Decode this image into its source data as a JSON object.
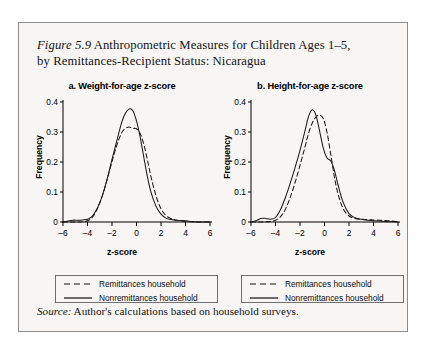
{
  "figure": {
    "number_label": "Figure 5.9",
    "title_line1": " Anthropometric Measures for Children Ages 1–5,",
    "title_line2": "by Remittances-Recipient Status: Nicaragua",
    "source_label": "Source:",
    "source_text": " Author's calculations based on household surveys."
  },
  "legend": {
    "dashed_label": "Remittances household",
    "solid_label": "Nonremittances household"
  },
  "chart_data": [
    {
      "type": "line",
      "panel_label": "a.",
      "title": "a. Weight-for-age z-score",
      "xlabel": "z-score",
      "ylabel": "Frequency",
      "xlim": [
        -6,
        6
      ],
      "ylim": [
        0,
        0.4
      ],
      "xticks": [
        -6,
        -4,
        -2,
        0,
        2,
        4,
        6
      ],
      "yticks": [
        0,
        0.1,
        0.2,
        0.3,
        0.4
      ],
      "grid": false,
      "legend_position": "below",
      "series": [
        {
          "name": "Nonremittances household",
          "style": "solid",
          "x": [
            -6.0,
            -5.6,
            -5.2,
            -4.8,
            -4.4,
            -4.0,
            -3.6,
            -3.2,
            -2.8,
            -2.4,
            -2.0,
            -1.6,
            -1.2,
            -0.9,
            -0.6,
            -0.3,
            0.0,
            0.3,
            0.6,
            0.9,
            1.2,
            1.6,
            2.0,
            2.4,
            2.8,
            3.2,
            3.6,
            4.0,
            4.4,
            5.0,
            6.0
          ],
          "y": [
            0.0,
            0.003,
            0.006,
            0.006,
            0.007,
            0.009,
            0.02,
            0.046,
            0.086,
            0.143,
            0.209,
            0.272,
            0.333,
            0.363,
            0.377,
            0.371,
            0.337,
            0.283,
            0.215,
            0.149,
            0.097,
            0.052,
            0.026,
            0.013,
            0.008,
            0.006,
            0.005,
            0.004,
            0.002,
            0.0,
            0.0
          ]
        },
        {
          "name": "Remittances household",
          "style": "dashed",
          "x": [
            -6.0,
            -5.6,
            -5.2,
            -4.8,
            -4.4,
            -4.0,
            -3.6,
            -3.2,
            -2.8,
            -2.4,
            -2.0,
            -1.6,
            -1.2,
            -0.9,
            -0.6,
            -0.3,
            0.0,
            0.3,
            0.6,
            0.9,
            1.2,
            1.6,
            2.0,
            2.4,
            2.8,
            3.2,
            3.6,
            4.0,
            4.4,
            5.0,
            6.0
          ],
          "y": [
            0.0,
            0.0,
            0.0,
            0.0,
            0.001,
            0.004,
            0.016,
            0.044,
            0.086,
            0.141,
            0.201,
            0.257,
            0.298,
            0.312,
            0.317,
            0.312,
            0.311,
            0.295,
            0.259,
            0.205,
            0.148,
            0.086,
            0.044,
            0.022,
            0.012,
            0.007,
            0.004,
            0.002,
            0.001,
            0.0,
            0.0
          ]
        }
      ]
    },
    {
      "type": "line",
      "panel_label": "b.",
      "title": "b. Height-for-age z-score",
      "xlabel": "z-score",
      "ylabel": "Frequency",
      "xlim": [
        -6,
        6
      ],
      "ylim": [
        0,
        0.4
      ],
      "xticks": [
        -6,
        -4,
        -2,
        0,
        2,
        4,
        6
      ],
      "yticks": [
        0,
        0.1,
        0.2,
        0.3,
        0.4
      ],
      "grid": false,
      "legend_position": "below",
      "series": [
        {
          "name": "Nonremittances household",
          "style": "solid",
          "x": [
            -6.0,
            -5.6,
            -5.2,
            -4.8,
            -4.4,
            -4.0,
            -3.6,
            -3.2,
            -2.8,
            -2.4,
            -2.0,
            -1.6,
            -1.3,
            -1.0,
            -0.7,
            -0.4,
            -0.1,
            0.2,
            0.5,
            0.8,
            1.1,
            1.5,
            2.0,
            2.5,
            3.0,
            3.5,
            4.0,
            4.5,
            5.0,
            5.5,
            6.0
          ],
          "y": [
            0.0,
            0.004,
            0.012,
            0.012,
            0.009,
            0.015,
            0.041,
            0.081,
            0.129,
            0.182,
            0.239,
            0.303,
            0.352,
            0.374,
            0.356,
            0.303,
            0.246,
            0.213,
            0.204,
            0.174,
            0.125,
            0.068,
            0.028,
            0.014,
            0.009,
            0.006,
            0.004,
            0.003,
            0.002,
            0.001,
            0.0
          ]
        },
        {
          "name": "Remittances household",
          "style": "dashed",
          "x": [
            -6.0,
            -5.6,
            -5.2,
            -4.8,
            -4.4,
            -4.0,
            -3.6,
            -3.2,
            -2.8,
            -2.4,
            -2.0,
            -1.6,
            -1.3,
            -1.0,
            -0.7,
            -0.4,
            -0.1,
            0.2,
            0.5,
            0.8,
            1.1,
            1.5,
            2.0,
            2.5,
            3.0,
            3.5,
            4.0,
            4.5,
            5.0,
            5.5,
            6.0
          ],
          "y": [
            0.0,
            0.0,
            0.0,
            0.001,
            0.002,
            0.006,
            0.017,
            0.042,
            0.082,
            0.132,
            0.189,
            0.249,
            0.296,
            0.33,
            0.35,
            0.356,
            0.345,
            0.3,
            0.228,
            0.152,
            0.095,
            0.046,
            0.02,
            0.012,
            0.009,
            0.008,
            0.007,
            0.006,
            0.005,
            0.003,
            0.0
          ]
        }
      ]
    }
  ]
}
